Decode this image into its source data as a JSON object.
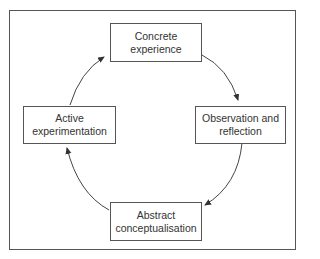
{
  "diagram": {
    "type": "cycle",
    "nodes": [
      {
        "id": "concrete",
        "lines": [
          "Concrete",
          "experience"
        ]
      },
      {
        "id": "observation",
        "lines": [
          "Observation and",
          "reflection"
        ]
      },
      {
        "id": "abstract",
        "lines": [
          "Abstract",
          "conceptualisation"
        ]
      },
      {
        "id": "active",
        "lines": [
          "Active",
          "experimentation"
        ]
      }
    ],
    "edges": [
      {
        "from": "concrete",
        "to": "observation"
      },
      {
        "from": "observation",
        "to": "abstract"
      },
      {
        "from": "abstract",
        "to": "active"
      },
      {
        "from": "active",
        "to": "concrete"
      }
    ],
    "colors": {
      "line": "#555555",
      "text": "#333333",
      "background": "#ffffff"
    }
  }
}
